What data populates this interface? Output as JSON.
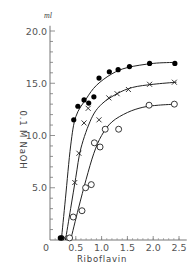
{
  "chart_data": {
    "type": "scatter",
    "title": "",
    "xlabel": "Riboflavin",
    "ylabel": "0.1 M NaOH",
    "y_unit": "ml",
    "xlim": [
      0,
      2.6
    ],
    "ylim": [
      0,
      21
    ],
    "x_ticks": [
      "0",
      "0.5",
      "1.0",
      "1.5",
      "2.0",
      "2.5"
    ],
    "y_ticks": [
      "5.0",
      "10.0",
      "15.0",
      "20.0"
    ],
    "grid": false,
    "legend": "none",
    "series": [
      {
        "name": "filled circles",
        "marker": "filled-circle",
        "points": [
          [
            0.2,
            0.2
          ],
          [
            0.23,
            0.2
          ],
          [
            0.46,
            11.5
          ],
          [
            0.54,
            12.8
          ],
          [
            0.66,
            13.4
          ],
          [
            0.75,
            13.1
          ],
          [
            0.85,
            13.7
          ],
          [
            0.95,
            15.5
          ],
          [
            1.15,
            16.1
          ],
          [
            1.32,
            16.3
          ],
          [
            1.54,
            16.6
          ],
          [
            1.93,
            16.9
          ],
          [
            2.42,
            16.9
          ]
        ],
        "curve": [
          [
            0.22,
            0
          ],
          [
            0.3,
            4
          ],
          [
            0.4,
            9
          ],
          [
            0.5,
            11.8
          ],
          [
            0.7,
            13.5
          ],
          [
            0.9,
            14.8
          ],
          [
            1.2,
            15.9
          ],
          [
            1.5,
            16.5
          ],
          [
            2.0,
            16.9
          ],
          [
            2.45,
            17.0
          ]
        ]
      },
      {
        "name": "crosses",
        "marker": "x",
        "points": [
          [
            0.28,
            0.2
          ],
          [
            0.48,
            5.5
          ],
          [
            0.56,
            8.3
          ],
          [
            0.66,
            11.2
          ],
          [
            0.95,
            11.5
          ],
          [
            0.74,
            12.6
          ],
          [
            1.14,
            13.6
          ],
          [
            1.3,
            14.0
          ],
          [
            1.52,
            14.4
          ],
          [
            1.93,
            14.9
          ],
          [
            2.41,
            15.1
          ]
        ],
        "curve": [
          [
            0.3,
            0
          ],
          [
            0.4,
            3
          ],
          [
            0.5,
            6
          ],
          [
            0.6,
            8.8
          ],
          [
            0.8,
            11.6
          ],
          [
            1.0,
            13.0
          ],
          [
            1.3,
            14.0
          ],
          [
            1.6,
            14.6
          ],
          [
            2.0,
            14.9
          ],
          [
            2.45,
            15.1
          ]
        ]
      },
      {
        "name": "open circles",
        "marker": "open-circle",
        "points": [
          [
            0.38,
            0.2
          ],
          [
            0.45,
            2.2
          ],
          [
            0.62,
            2.8
          ],
          [
            0.69,
            5.0
          ],
          [
            0.8,
            5.3
          ],
          [
            0.86,
            9.3
          ],
          [
            0.97,
            8.9
          ],
          [
            1.07,
            10.6
          ],
          [
            1.33,
            10.6
          ],
          [
            1.92,
            12.9
          ],
          [
            2.41,
            13.0
          ]
        ],
        "curve": [
          [
            0.4,
            0
          ],
          [
            0.55,
            3
          ],
          [
            0.7,
            5.8
          ],
          [
            0.85,
            8.3
          ],
          [
            1.0,
            10.0
          ],
          [
            1.2,
            11.3
          ],
          [
            1.5,
            12.2
          ],
          [
            1.8,
            12.7
          ],
          [
            2.1,
            12.9
          ],
          [
            2.45,
            13.0
          ]
        ]
      }
    ]
  },
  "labels": {
    "x_axis": "Riboflavin",
    "y_axis": "0.1 M NaOH",
    "y_unit": "ml"
  }
}
